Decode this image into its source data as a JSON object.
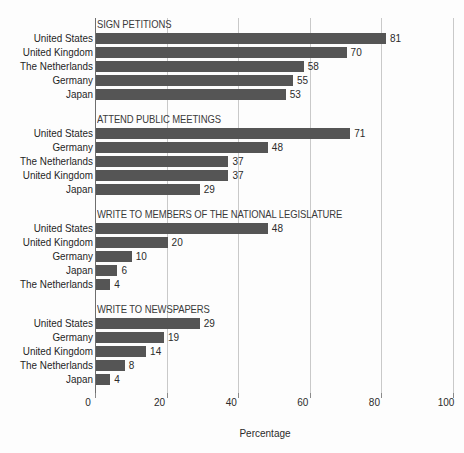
{
  "chart_data": {
    "type": "bar",
    "orientation": "horizontal",
    "title": "",
    "xlabel": "Percentage",
    "ylabel": "",
    "xlim": [
      0,
      100
    ],
    "xticks": [
      0,
      20,
      40,
      60,
      80,
      100
    ],
    "xtick_labels": [
      "0",
      "20",
      "40",
      "60",
      "80",
      "100"
    ],
    "grid": true,
    "legend": "none",
    "bar_color": "#555555",
    "groups": [
      {
        "title": "SIGN PETITIONS",
        "categories": [
          "United States",
          "United Kingdom",
          "The Netherlands",
          "Germany",
          "Japan"
        ],
        "values": [
          81,
          70,
          58,
          55,
          53
        ]
      },
      {
        "title": "ATTEND PUBLIC MEETINGS",
        "categories": [
          "United States",
          "Germany",
          "The Netherlands",
          "United Kingdom",
          "Japan"
        ],
        "values": [
          71,
          48,
          37,
          37,
          29
        ]
      },
      {
        "title": "WRITE TO MEMBERS OF THE NATIONAL LEGISLATURE",
        "categories": [
          "United States",
          "United Kingdom",
          "Germany",
          "Japan",
          "The Netherlands"
        ],
        "values": [
          48,
          20,
          10,
          6,
          4
        ]
      },
      {
        "title": "WRITE TO NEWSPAPERS",
        "categories": [
          "United States",
          "Germany",
          "United Kingdom",
          "The Netherlands",
          "Japan"
        ],
        "values": [
          29,
          19,
          14,
          8,
          4
        ]
      }
    ]
  }
}
